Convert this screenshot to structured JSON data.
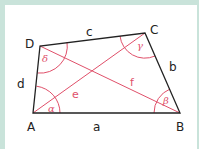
{
  "figure": {
    "colors": {
      "background_border": "#c9e3da",
      "panel": "#ffffff",
      "sides": "#222222",
      "accent": "#e0506a"
    },
    "vertices": [
      {
        "name": "A",
        "x": 33,
        "y": 113
      },
      {
        "name": "B",
        "x": 180,
        "y": 113
      },
      {
        "name": "C",
        "x": 145,
        "y": 33
      },
      {
        "name": "D",
        "x": 40,
        "y": 46
      }
    ],
    "vertex_labels": {
      "A": "A",
      "B": "B",
      "C": "C",
      "D": "D"
    },
    "side_labels": {
      "a": "a",
      "b": "b",
      "c": "c",
      "d": "d"
    },
    "diagonal_labels": {
      "e": "e",
      "f": "f"
    },
    "angle_labels": {
      "alpha": "α",
      "beta": "β",
      "gamma": "γ",
      "delta": "δ"
    }
  }
}
